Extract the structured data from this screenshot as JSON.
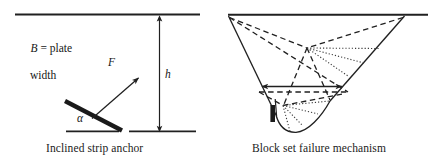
{
  "figure": {
    "left_panel": {
      "caption": "Inclined strip anchor",
      "labels": {
        "plate_width_symbol": "B",
        "plate_width_eq": " = plate",
        "plate_width_second_line": "width",
        "force": "F",
        "depth": "h",
        "angle": "α"
      },
      "icons": {
        "ground_surface": "ground-line-icon",
        "anchor_plate": "inclined-plate-icon",
        "force_arrow": "force-arrow-icon",
        "depth_dimension": "depth-dimension-icon"
      }
    },
    "right_panel": {
      "caption": "Block set failure mechanism",
      "icons": {
        "ground_surface": "ground-line-icon",
        "failure_block": "failure-block-icon",
        "anchor_plate": "anchor-plate-icon",
        "width_arrow": "double-headed-width-arrow-icon",
        "dashed_slip_lines": "dashed-slip-line-icon",
        "dotted_fan_lines": "dotted-fan-line-icon"
      }
    },
    "colors": {
      "ink": "#1a1a1a",
      "line": "#202020",
      "background": "#ffffff"
    }
  }
}
